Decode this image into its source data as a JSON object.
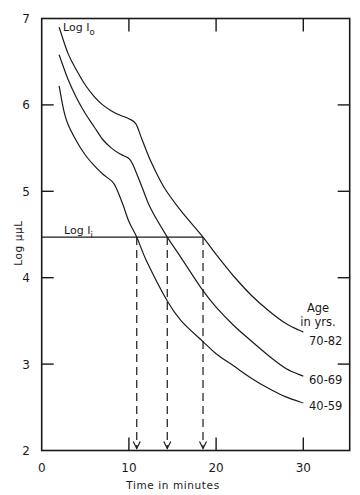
{
  "chart_data": {
    "type": "line",
    "title": "",
    "xlabel": "Time in minutes",
    "ylabel": "Log μμL",
    "xlim": [
      0,
      35
    ],
    "ylim": [
      2,
      7
    ],
    "x_ticks": [
      0,
      10,
      20,
      30
    ],
    "x_tick_labels": [
      "0",
      "10",
      "20",
      "30"
    ],
    "y_ticks": [
      2,
      3,
      4,
      5,
      6,
      7
    ],
    "y_tick_labels": [
      "2",
      "3",
      "4",
      "5",
      "6",
      "7"
    ],
    "grid": false,
    "legend_title": [
      "Age",
      "in yrs."
    ],
    "legend_position": "right, at curve ends",
    "series": [
      {
        "name": "70-82",
        "x": [
          2,
          3,
          4,
          5,
          6,
          7,
          8,
          9,
          10,
          10.8,
          11.5,
          12.5,
          14,
          16,
          18.5,
          20,
          22,
          24,
          26,
          28,
          30
        ],
        "values": [
          6.9,
          6.6,
          6.4,
          6.23,
          6.1,
          6.0,
          5.93,
          5.88,
          5.84,
          5.78,
          5.6,
          5.35,
          5.05,
          4.77,
          4.47,
          4.27,
          4.02,
          3.8,
          3.62,
          3.47,
          3.37
        ]
      },
      {
        "name": "60-69",
        "x": [
          2,
          3,
          4,
          5,
          6,
          7,
          8,
          9,
          10,
          10.5,
          11.5,
          12.5,
          14.4,
          16,
          18.5,
          20,
          22,
          24,
          26,
          28,
          30
        ],
        "values": [
          6.58,
          6.3,
          6.08,
          5.9,
          5.75,
          5.6,
          5.5,
          5.43,
          5.38,
          5.3,
          5.05,
          4.8,
          4.47,
          4.23,
          3.85,
          3.66,
          3.45,
          3.27,
          3.1,
          2.95,
          2.86
        ]
      },
      {
        "name": "40-59",
        "x": [
          2,
          2.5,
          3,
          4,
          5,
          6,
          7,
          8,
          8.5,
          9.3,
          10,
          10.9,
          12,
          14.4,
          16,
          18.5,
          20,
          22,
          24,
          26,
          28,
          30
        ],
        "values": [
          6.22,
          5.95,
          5.78,
          5.58,
          5.42,
          5.3,
          5.2,
          5.12,
          5.05,
          4.85,
          4.65,
          4.47,
          4.2,
          3.73,
          3.5,
          3.26,
          3.12,
          2.98,
          2.84,
          2.72,
          2.62,
          2.55
        ]
      }
    ],
    "reference_line": {
      "label": "Log I",
      "subscript": "i",
      "y": 4.47,
      "x_from": 0,
      "x_to": 18.5
    },
    "top_annotation": {
      "label": "Log I",
      "subscript": "o",
      "x": 2,
      "y": 6.9
    },
    "threshold_times": [
      {
        "series": "40-59",
        "x": 10.9
      },
      {
        "series": "60-69",
        "x": 14.4
      },
      {
        "series": "70-82",
        "x": 18.5
      }
    ]
  }
}
